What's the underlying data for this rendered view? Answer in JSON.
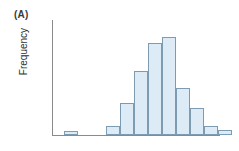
{
  "figure": {
    "panel_label": "(A)",
    "background_color": "#ffffff"
  },
  "axes": {
    "y_label": "Frequency",
    "x_label": "",
    "axis_color": "#8a8a8a",
    "y_ticks": [],
    "x_ticks": []
  },
  "style": {
    "bar_fill": "#dcebf5",
    "bar_border": "#7d9cb2",
    "label_color": "#2f2f2f"
  },
  "chart_data": {
    "type": "bar",
    "title": "(A)",
    "xlabel": "",
    "ylabel": "Frequency",
    "grid": false,
    "legend": false,
    "categories": [
      "1",
      "2",
      "3",
      "4",
      "5",
      "6",
      "7",
      "8",
      "9",
      "10",
      "11",
      "12"
    ],
    "values": [
      3,
      0,
      0,
      7,
      26,
      52,
      75,
      80,
      38,
      22,
      7,
      4
    ],
    "ylim": [
      0,
      88
    ]
  }
}
